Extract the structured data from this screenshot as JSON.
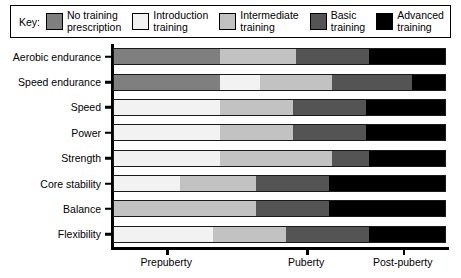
{
  "legend": {
    "title": "Key:",
    "entries": [
      {
        "label": "No training\nprescription",
        "color": "#7f7f7f",
        "key": "no-training"
      },
      {
        "label": "Introduction\ntraining",
        "color": "#f2f2f2",
        "key": "introduction"
      },
      {
        "label": "Intermediate\ntraining",
        "color": "#c2c2c2",
        "key": "intermediate"
      },
      {
        "label": "Basic\ntraining",
        "color": "#545454",
        "key": "basic"
      },
      {
        "label": "Advanced\ntraining",
        "color": "#000000",
        "key": "advanced"
      }
    ]
  },
  "chart_data": {
    "type": "bar",
    "orientation": "horizontal",
    "stacked": true,
    "title": "",
    "xlabel": "",
    "ylabel": "",
    "grid": false,
    "legend_position": "top",
    "categories": [
      "Aerobic endurance",
      "Speed endurance",
      "Speed",
      "Power",
      "Strength",
      "Core stability",
      "Balance",
      "Flexibility"
    ],
    "x_tick_labels": [
      "Prepuberty",
      "Puberty",
      "Post-puberty"
    ],
    "x_tick_positions": [
      16,
      58,
      87
    ],
    "xlim": [
      0,
      100
    ],
    "series": [
      {
        "name": "No training prescription",
        "color": "#7f7f7f",
        "values": [
          32,
          32,
          0,
          0,
          0,
          0,
          0,
          0
        ]
      },
      {
        "name": "Introduction training",
        "color": "#f2f2f2",
        "values": [
          0,
          12,
          32,
          32,
          32,
          20,
          0,
          30
        ]
      },
      {
        "name": "Intermediate training",
        "color": "#c2c2c2",
        "values": [
          23,
          22,
          22,
          22,
          34,
          23,
          43,
          22
        ]
      },
      {
        "name": "Basic training",
        "color": "#545454",
        "values": [
          22,
          24,
          22,
          22,
          11,
          22,
          22,
          25
        ]
      },
      {
        "name": "Advanced training",
        "color": "#000000",
        "values": [
          23,
          10,
          24,
          24,
          23,
          35,
          35,
          23
        ]
      }
    ]
  }
}
